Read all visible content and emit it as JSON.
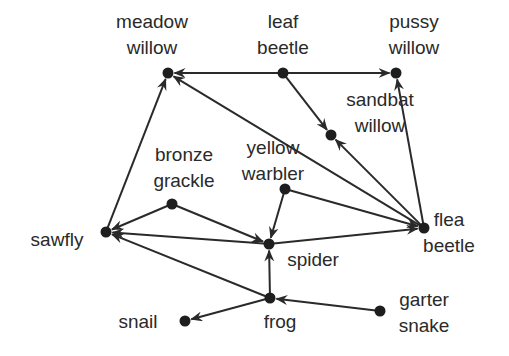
{
  "diagram": {
    "type": "food web",
    "colors": {
      "ink": "#2a2a2a",
      "node": "#1e1e1e",
      "background": "#ffffff"
    },
    "nodes": [
      {
        "id": "meadow_willow",
        "lines": [
          "meadow",
          "willow"
        ],
        "x": 168,
        "y": 73,
        "lx": 152,
        "ly": 28
      },
      {
        "id": "leaf_beetle",
        "lines": [
          "leaf",
          "beetle"
        ],
        "x": 283,
        "y": 73,
        "lx": 283,
        "ly": 28
      },
      {
        "id": "pussy_willow",
        "lines": [
          "pussy",
          "willow"
        ],
        "x": 396,
        "y": 73,
        "lx": 414,
        "ly": 28
      },
      {
        "id": "sandbat_willow",
        "lines": [
          "sandbat",
          "willow"
        ],
        "x": 331,
        "y": 135,
        "lx": 380,
        "ly": 106
      },
      {
        "id": "bronze_grackle",
        "lines": [
          "bronze",
          "grackle"
        ],
        "x": 172,
        "y": 204,
        "lx": 184,
        "ly": 161
      },
      {
        "id": "yellow_warbler",
        "lines": [
          "yellow",
          "warbler"
        ],
        "x": 285,
        "y": 189,
        "lx": 273,
        "ly": 154
      },
      {
        "id": "sawfly",
        "lines": [
          "sawfly"
        ],
        "x": 106,
        "y": 232,
        "lx": 57,
        "ly": 246
      },
      {
        "id": "spider",
        "lines": [
          "spider"
        ],
        "x": 269,
        "y": 244,
        "lx": 313,
        "ly": 266
      },
      {
        "id": "flea_beetle",
        "lines": [
          "flea",
          "beetle"
        ],
        "x": 424,
        "y": 228,
        "lx": 449,
        "ly": 226
      },
      {
        "id": "frog",
        "lines": [
          "frog"
        ],
        "x": 270,
        "y": 298,
        "lx": 280,
        "ly": 328
      },
      {
        "id": "snail",
        "lines": [
          "snail"
        ],
        "x": 185,
        "y": 321,
        "lx": 138,
        "ly": 328
      },
      {
        "id": "garter_snake",
        "lines": [
          "garter",
          "snake"
        ],
        "x": 380,
        "y": 311,
        "lx": 424,
        "ly": 306
      }
    ],
    "edges": [
      {
        "from": "leaf_beetle",
        "to": "meadow_willow"
      },
      {
        "from": "leaf_beetle",
        "to": "pussy_willow"
      },
      {
        "from": "leaf_beetle",
        "to": "sandbat_willow"
      },
      {
        "from": "flea_beetle",
        "to": "meadow_willow"
      },
      {
        "from": "flea_beetle",
        "to": "sandbat_willow"
      },
      {
        "from": "flea_beetle",
        "to": "pussy_willow"
      },
      {
        "from": "sawfly",
        "to": "meadow_willow"
      },
      {
        "from": "bronze_grackle",
        "to": "sawfly"
      },
      {
        "from": "bronze_grackle",
        "to": "spider"
      },
      {
        "from": "yellow_warbler",
        "to": "spider"
      },
      {
        "from": "yellow_warbler",
        "to": "flea_beetle"
      },
      {
        "from": "spider",
        "to": "sawfly"
      },
      {
        "from": "spider",
        "to": "flea_beetle"
      },
      {
        "from": "frog",
        "to": "spider"
      },
      {
        "from": "frog",
        "to": "sawfly"
      },
      {
        "from": "frog",
        "to": "snail"
      },
      {
        "from": "garter_snake",
        "to": "frog"
      }
    ]
  }
}
